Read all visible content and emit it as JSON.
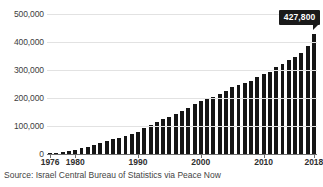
{
  "chart_data": {
    "type": "bar",
    "title": "",
    "subtitle": "",
    "xlabel": "",
    "ylabel": "",
    "grid": true,
    "legend": false,
    "ylim": [
      0,
      500000
    ],
    "ytick_labels": [
      "0",
      "100,000",
      "200,000",
      "300,000",
      "400,000",
      "500,000"
    ],
    "ytick_values": [
      0,
      100000,
      200000,
      300000,
      400000,
      500000
    ],
    "xtick_labels": [
      "1976",
      "1980",
      "1990",
      "2000",
      "2010",
      "2018"
    ],
    "xtick_values": [
      1976,
      1980,
      1990,
      2000,
      2010,
      2018
    ],
    "bar_color": "#151515",
    "categories": [
      1976,
      1977,
      1978,
      1979,
      1980,
      1981,
      1982,
      1983,
      1984,
      1985,
      1986,
      1987,
      1988,
      1989,
      1990,
      1991,
      1992,
      1993,
      1994,
      1995,
      1996,
      1997,
      1998,
      1999,
      2000,
      2001,
      2002,
      2003,
      2004,
      2005,
      2006,
      2007,
      2008,
      2009,
      2010,
      2011,
      2012,
      2013,
      2014,
      2015,
      2016,
      2017,
      2018
    ],
    "values": [
      3200,
      5000,
      8000,
      11000,
      14000,
      20000,
      25000,
      31000,
      38000,
      45000,
      52000,
      58000,
      64000,
      70000,
      78000,
      92000,
      104000,
      114000,
      124000,
      133000,
      142000,
      154000,
      166000,
      177000,
      190000,
      198000,
      205000,
      214000,
      225000,
      238000,
      248000,
      252000,
      262000,
      275000,
      285000,
      292000,
      312000,
      322000,
      334000,
      346000,
      362000,
      385000,
      427800
    ],
    "annotations": [
      {
        "name": "last-value-callout",
        "label": "427,800",
        "category": 2018,
        "value": 427800
      }
    ],
    "source_note": "Source: Israel Central Bureau of Statistics via Peace Now"
  }
}
